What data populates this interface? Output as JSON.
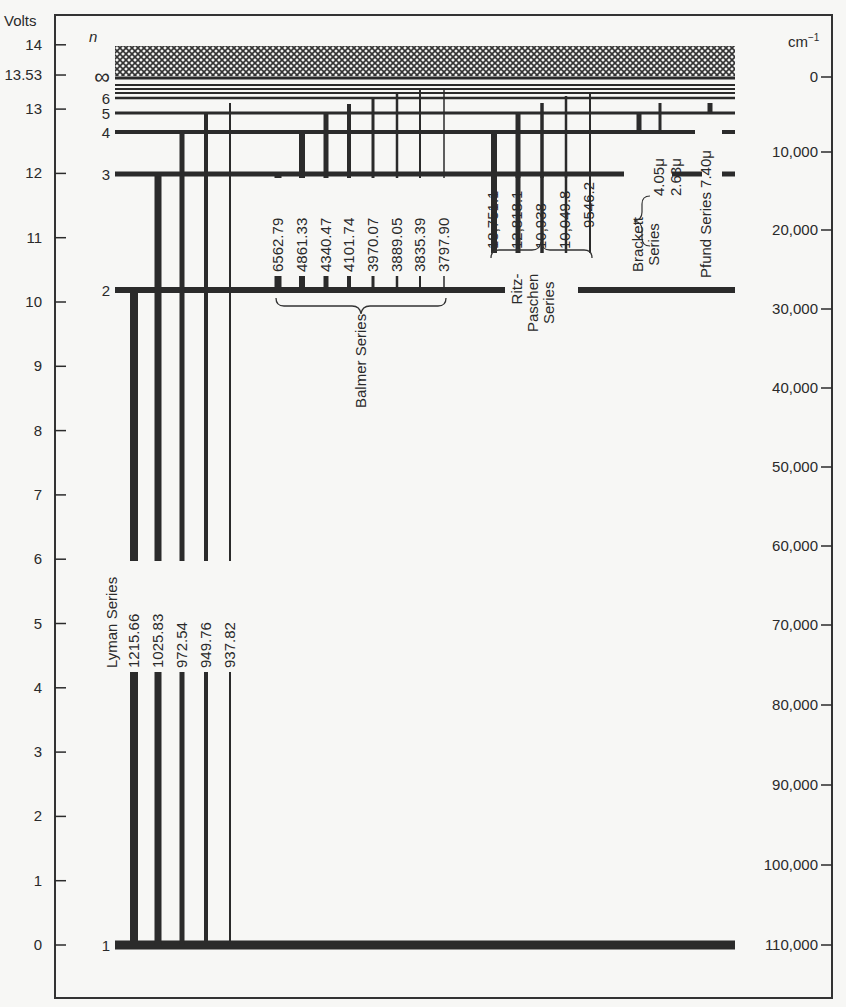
{
  "axes": {
    "left_label": "Volts",
    "n_label": "n",
    "right_label": "cm",
    "right_label_sup": "−1",
    "left_ticks": [
      {
        "label": "14",
        "value": 14
      },
      {
        "label": "13.53",
        "value": 13.53
      },
      {
        "label": "13",
        "value": 13
      },
      {
        "label": "12",
        "value": 12
      },
      {
        "label": "11",
        "value": 11
      },
      {
        "label": "10",
        "value": 10
      },
      {
        "label": "9",
        "value": 9
      },
      {
        "label": "8",
        "value": 8
      },
      {
        "label": "7",
        "value": 7
      },
      {
        "label": "6",
        "value": 6
      },
      {
        "label": "5",
        "value": 5
      },
      {
        "label": "4",
        "value": 4
      },
      {
        "label": "3",
        "value": 3
      },
      {
        "label": "2",
        "value": 2
      },
      {
        "label": "1",
        "value": 1
      },
      {
        "label": "0",
        "value": 0
      }
    ],
    "right_ticks": [
      {
        "label": "0",
        "y": 77
      },
      {
        "label": "10,000",
        "y": 152
      },
      {
        "label": "20,000",
        "y": 230
      },
      {
        "label": "30,000",
        "y": 309
      },
      {
        "label": "40,000",
        "y": 388
      },
      {
        "label": "50,000",
        "y": 467
      },
      {
        "label": "60,000",
        "y": 546
      },
      {
        "label": "70,000",
        "y": 625
      },
      {
        "label": "80,000",
        "y": 705
      },
      {
        "label": "90,000",
        "y": 785
      },
      {
        "label": "100,000",
        "y": 865
      },
      {
        "label": "110,000",
        "y": 945
      }
    ]
  },
  "levels": [
    {
      "n": "1",
      "y": 945,
      "width": 9,
      "label": "1"
    },
    {
      "n": "2",
      "y": 290,
      "width": 6,
      "label": "2"
    },
    {
      "n": "3",
      "y": 174,
      "width": 5,
      "label": "3"
    },
    {
      "n": "4",
      "y": 132,
      "width": 4,
      "label": "4"
    },
    {
      "n": "5",
      "y": 113,
      "width": 3,
      "label": "5"
    },
    {
      "n": "6",
      "y": 98,
      "width": 2.5,
      "label": "6"
    },
    {
      "n": "7",
      "y": 93,
      "width": 2,
      "label": ""
    },
    {
      "n": "8",
      "y": 89,
      "width": 2,
      "label": ""
    },
    {
      "n": "9",
      "y": 85,
      "width": 2,
      "label": ""
    },
    {
      "n": "∞",
      "y": 78,
      "width": 3,
      "label": "∞"
    }
  ],
  "continuum": {
    "label": "ionization continuum",
    "y_top": 46,
    "y_bottom": 76
  },
  "chart_data": {
    "type": "energy-level-diagram",
    "title": "",
    "ylabel_left": "Volts",
    "ylabel_right": "cm^-1",
    "ylim_volts": [
      0,
      14
    ],
    "ionization_potential_volts": 13.53,
    "levels_n": [
      "1",
      "2",
      "3",
      "4",
      "5",
      "6",
      "∞"
    ],
    "series": [
      {
        "name": "Lyman Series",
        "lower_level": 1,
        "wavelengths": [
          "1215.66",
          "1025.83",
          "972.54",
          "949.76",
          "937.82"
        ],
        "upper_levels": [
          2,
          3,
          4,
          5,
          6
        ],
        "x": [
          134,
          158,
          182,
          206,
          230
        ],
        "thickness": [
          8,
          7,
          5,
          4,
          2
        ],
        "y_top": [
          290,
          174,
          132,
          113,
          103
        ]
      },
      {
        "name": "Balmer Series",
        "lower_level": 2,
        "wavelengths": [
          "6562.79",
          "4861.33",
          "4340.47",
          "4101.74",
          "3970.07",
          "3889.05",
          "3835.39",
          "3797.90"
        ],
        "upper_levels": [
          3,
          4,
          5,
          6,
          7,
          8,
          9,
          10
        ],
        "x": [
          278,
          302,
          326,
          349,
          373,
          397,
          420,
          444
        ],
        "thickness": [
          7,
          6,
          5,
          4,
          3,
          2.5,
          2,
          1.5
        ],
        "y_top": [
          174,
          132,
          113,
          104,
          97,
          93,
          90,
          88
        ]
      },
      {
        "name": "Ritz-Paschen Series",
        "lower_level": 3,
        "wavelengths": [
          "18,751.1",
          "12,818.1",
          "10,938",
          "10,049.8",
          "9546.2"
        ],
        "upper_levels": [
          4,
          5,
          6,
          7,
          8
        ],
        "x": [
          494,
          518,
          542,
          566,
          590
        ],
        "thickness": [
          6,
          5,
          3.5,
          2.5,
          2
        ],
        "y_top": [
          132,
          113,
          103,
          96,
          93
        ]
      },
      {
        "name": "Brackett Series",
        "lower_level": 4,
        "wavelengths": [
          "4.05μ",
          "2.63μ"
        ],
        "upper_levels": [
          5,
          6
        ],
        "x": [
          639,
          660
        ],
        "thickness": [
          5,
          3
        ],
        "y_top": [
          113,
          103
        ]
      },
      {
        "name": "Pfund Series",
        "lower_level": 5,
        "wavelengths": [
          "7.40μ"
        ],
        "upper_levels": [
          6
        ],
        "x": [
          710
        ],
        "thickness": [
          5
        ],
        "y_top": [
          103
        ]
      }
    ]
  },
  "labels": {
    "lyman": "Lyman Series",
    "balmer": "Balmer Series",
    "paschen_1": "Ritz-",
    "paschen_2": "Paschen",
    "paschen_3": "Series",
    "brackett_1": "Brackett",
    "brackett_2": "Series",
    "pfund": "Pfund Series",
    "brackett_w1": "4.05μ",
    "brackett_w2": "2.63μ",
    "pfund_w1": "7.40μ"
  }
}
